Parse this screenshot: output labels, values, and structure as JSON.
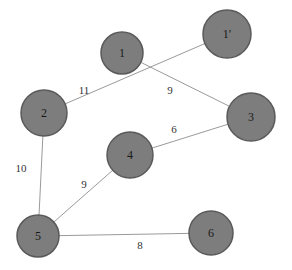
{
  "diagram": {
    "type": "weighted-undirected-graph",
    "colors": {
      "background": "#ffffff",
      "node_fill": "#7d7d7d",
      "node_stroke": "#5a5a5a",
      "edge": "#9a9a9a",
      "text": "#1a1a1a"
    },
    "nodes": [
      {
        "id": "1",
        "label": "1",
        "x": 122,
        "y": 53,
        "r": 21
      },
      {
        "id": "1p",
        "label": "1′",
        "x": 227,
        "y": 34,
        "r": 24
      },
      {
        "id": "3",
        "label": "3",
        "x": 251,
        "y": 117,
        "r": 24
      },
      {
        "id": "2",
        "label": "2",
        "x": 44,
        "y": 113,
        "r": 23
      },
      {
        "id": "4",
        "label": "4",
        "x": 130,
        "y": 155,
        "r": 23
      },
      {
        "id": "5",
        "label": "5",
        "x": 38,
        "y": 236,
        "r": 21
      },
      {
        "id": "6",
        "label": "6",
        "x": 211,
        "y": 233,
        "r": 22
      }
    ],
    "edges": [
      {
        "from": "2",
        "to": "1p",
        "weight": "11",
        "label_x": 84,
        "label_y": 90
      },
      {
        "from": "1",
        "to": "3",
        "weight": "9",
        "label_x": 170,
        "label_y": 90
      },
      {
        "from": "4",
        "to": "3",
        "weight": "6",
        "label_x": 174,
        "label_y": 129
      },
      {
        "from": "2",
        "to": "5",
        "weight": "10",
        "label_x": 21,
        "label_y": 168
      },
      {
        "from": "5",
        "to": "4",
        "weight": "9",
        "label_x": 84,
        "label_y": 184
      },
      {
        "from": "5",
        "to": "6",
        "weight": "8",
        "label_x": 140,
        "label_y": 245
      }
    ]
  }
}
